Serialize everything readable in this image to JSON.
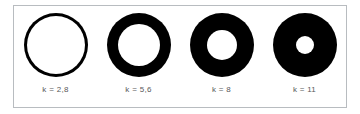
{
  "figure": {
    "frame_border_color": "#b8bcc0",
    "background_color": "#ffffff",
    "ring_color": "#000000",
    "label_color": "#58585a"
  },
  "chart_data": {
    "type": "diagram",
    "title": "",
    "xlabel": "",
    "ylabel": "",
    "categories": [
      "k = 2,8",
      "k = 5,6",
      "k = 8",
      "k = 11"
    ],
    "values": [
      2.8,
      5.6,
      8,
      11
    ],
    "series": [
      {
        "name": "outer_diameter_px",
        "values": [
          64,
          64,
          64,
          64
        ]
      },
      {
        "name": "inner_hole_diameter_px",
        "values": [
          58,
          42,
          30,
          18
        ]
      },
      {
        "name": "ring_thickness_px",
        "values": [
          3,
          11,
          17,
          23
        ]
      }
    ]
  },
  "rings": [
    {
      "id": "ring-1",
      "label": "k = 2,8",
      "k_value": "2,8",
      "outer": 64,
      "hole": 58
    },
    {
      "id": "ring-2",
      "label": "k = 5,6",
      "k_value": "5,6",
      "outer": 64,
      "hole": 42
    },
    {
      "id": "ring-3",
      "label": "k = 8",
      "k_value": "8",
      "outer": 64,
      "hole": 30
    },
    {
      "id": "ring-4",
      "label": "k = 11",
      "k_value": "11",
      "outer": 64,
      "hole": 18
    }
  ]
}
